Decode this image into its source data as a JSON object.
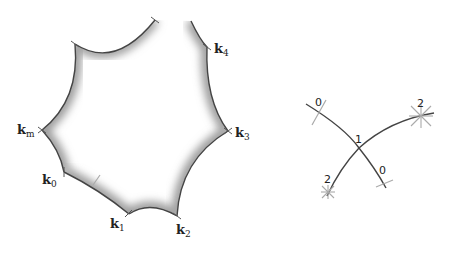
{
  "left_diagram": {
    "description": "Hyperbolic-like polygon with cusped vertices and shaded interior edges",
    "vertex_labels": {
      "k4": {
        "base": "k",
        "sub": "4"
      },
      "k3": {
        "base": "k",
        "sub": "3"
      },
      "k2": {
        "base": "k",
        "sub": "2"
      },
      "k1": {
        "base": "k",
        "sub": "1"
      },
      "k0": {
        "base": "k",
        "sub": "0"
      },
      "km": {
        "base": "k",
        "sub": "m"
      }
    }
  },
  "right_diagram": {
    "description": "Two crossing arcs with labeled markers",
    "labels": {
      "top_left": "0",
      "center": "1",
      "top_right": "2",
      "bottom_left": "2",
      "bottom_right": "0"
    }
  },
  "colors": {
    "stroke": "#444444",
    "shade": "#9a9a9a",
    "marker_light": "#aaaaaa"
  }
}
